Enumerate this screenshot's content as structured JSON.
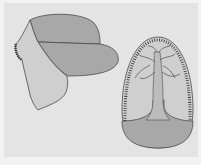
{
  "diagram": {
    "type": "medical-illustration",
    "figures": [
      {
        "id": "folded-flap",
        "description": "folded tissue flap, left"
      },
      {
        "id": "oval-flap",
        "description": "oval flap with branching vessel and sutured margin, right"
      }
    ],
    "colors": {
      "background": "#e4e4e4",
      "border": "#f2f2f2",
      "light_fill": "#cfcfcf",
      "dark_fill": "#a8a8a8",
      "stroke": "#4a4a4a"
    },
    "labels": []
  }
}
